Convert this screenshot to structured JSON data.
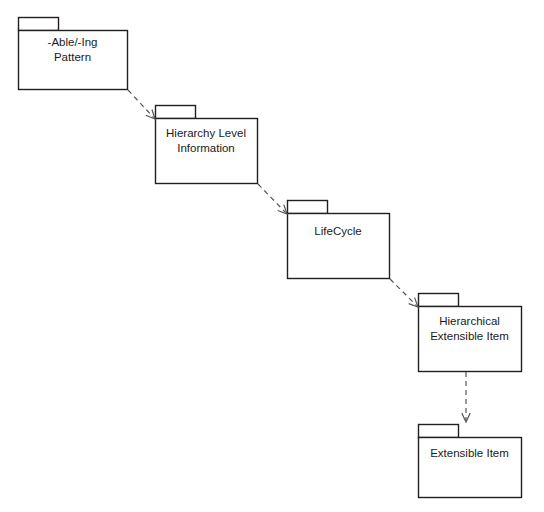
{
  "diagram": {
    "type": "uml-package-diagram",
    "background_color": "#ffffff",
    "stroke_color": "#231f20",
    "text_color": "#1a1a1a",
    "width": 544,
    "height": 512,
    "packages": [
      {
        "id": "able-ing-pattern",
        "label": "-Able/-Ing\nPattern",
        "label_lines": [
          "-Able/-Ing",
          "Pattern"
        ],
        "x": 18,
        "y": 17,
        "width": 109,
        "height": 72,
        "tab_width": 40,
        "tab_height": 13
      },
      {
        "id": "hierarchy-level-information",
        "label": "Hierarchy Level\nInformation",
        "label_lines": [
          "Hierarchy Level",
          "Information"
        ],
        "x": 155,
        "y": 105,
        "width": 102,
        "height": 78,
        "tab_width": 40,
        "tab_height": 13
      },
      {
        "id": "lifecycle",
        "label": "LifeCycle",
        "label_lines": [
          "LifeCycle"
        ],
        "x": 287,
        "y": 200,
        "width": 102,
        "height": 78,
        "tab_width": 40,
        "tab_height": 13
      },
      {
        "id": "hierarchical-extensible-item",
        "label": "Hierarchical\nExtensible Item",
        "label_lines": [
          "Hierarchical",
          "Extensible Item"
        ],
        "x": 418,
        "y": 293,
        "width": 103,
        "height": 78,
        "tab_width": 40,
        "tab_height": 13
      },
      {
        "id": "extensible-item",
        "label": "Extensible Item",
        "label_lines": [
          "Extensible Item"
        ],
        "x": 418,
        "y": 424,
        "width": 103,
        "height": 73,
        "tab_width": 40,
        "tab_height": 13
      }
    ],
    "connectors": [
      {
        "id": "dep-able-ing-to-hierarchy-level",
        "from": "able-ing-pattern",
        "to": "hierarchy-level-information",
        "style": "dashed",
        "arrowhead": "open",
        "x1": 128,
        "y1": 90,
        "x2": 155,
        "y2": 119
      },
      {
        "id": "dep-hierarchy-level-to-lifecycle",
        "from": "hierarchy-level-information",
        "to": "lifecycle",
        "style": "dashed",
        "arrowhead": "open",
        "x1": 258,
        "y1": 184,
        "x2": 287,
        "y2": 214
      },
      {
        "id": "dep-lifecycle-to-hierarchical-extensible",
        "from": "lifecycle",
        "to": "hierarchical-extensible-item",
        "style": "dashed",
        "arrowhead": "open",
        "x1": 390,
        "y1": 279,
        "x2": 418,
        "y2": 307
      },
      {
        "id": "dep-hierarchical-extensible-to-extensible",
        "from": "hierarchical-extensible-item",
        "to": "extensible-item",
        "style": "dashed",
        "arrowhead": "open",
        "x1": 466,
        "y1": 372,
        "x2": 466,
        "y2": 422
      }
    ]
  }
}
